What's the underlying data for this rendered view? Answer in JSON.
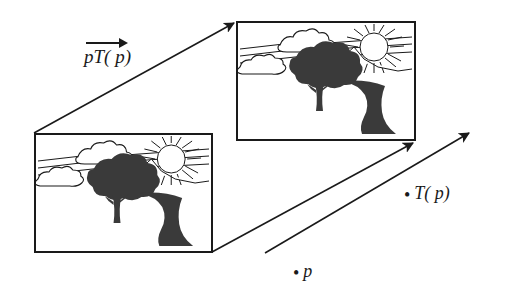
{
  "figure": {
    "background_color": "#ffffff",
    "ink_color": "#1a1a1a",
    "width": 509,
    "height": 302
  },
  "labels": {
    "transform_vector": {
      "name": "pT(p)-vector-label",
      "text": "pT( p)",
      "parts": {
        "p1": "p",
        "T": "T",
        "open": "(",
        "p2": "p",
        "close": ")"
      },
      "has_overhead_arrow": true
    },
    "point_image": {
      "name": "T(p)-point-label",
      "bullet": "•",
      "text": "T( p)",
      "parts": {
        "T": "T",
        "open": "(",
        "p": "p",
        "close": ")"
      }
    },
    "point_source": {
      "name": "p-point-label",
      "bullet": "•",
      "text": "p"
    }
  },
  "boxes": [
    {
      "id": "box-lower",
      "name": "source-image-frame",
      "x": 34,
      "y": 133,
      "width": 179,
      "height": 120,
      "border_color": "#1a1a1a",
      "scene": "landscape-with-tree-sun-clouds-river"
    },
    {
      "id": "box-upper",
      "name": "transformed-image-frame",
      "x": 236,
      "y": 21,
      "width": 180,
      "height": 120,
      "border_color": "#1a1a1a",
      "scene": "landscape-with-tree-sun-clouds-river"
    }
  ],
  "arrows": [
    {
      "id": "arrow-top-left",
      "name": "frame-corner-arrow-top-left",
      "from": [
        34,
        133
      ],
      "to": [
        236,
        22
      ],
      "has_head": true
    },
    {
      "id": "arrow-bottom-right",
      "name": "frame-corner-arrow-bottom-right",
      "from": [
        212,
        252
      ],
      "to": [
        414,
        142
      ],
      "has_head": true
    },
    {
      "id": "arrow-point-map",
      "name": "point-mapping-arrow",
      "from": [
        265,
        253
      ],
      "to": [
        470,
        132
      ],
      "has_head": true
    }
  ],
  "scene_elements": {
    "sun": "sun-with-rays",
    "tree": "dark-leafy-tree",
    "clouds": "outlined-clouds",
    "river": "dark-winding-river",
    "mountains": "mountain-ridge-outline",
    "horizon": "horizon-lines"
  }
}
